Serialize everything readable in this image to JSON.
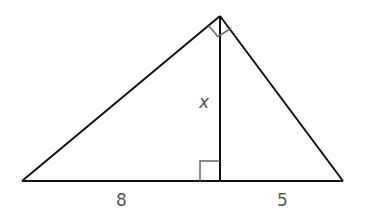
{
  "diagram": {
    "type": "right-triangle-with-altitude",
    "colors": {
      "stroke": "#111111",
      "marker": "#666666",
      "label": "#555555",
      "background": "#ffffff"
    },
    "points": {
      "apex": [
        220,
        16
      ],
      "left": [
        22,
        181
      ],
      "right": [
        343,
        181
      ],
      "foot": [
        220,
        181
      ]
    },
    "labels": {
      "left_segment": "8",
      "right_segment": "5",
      "altitude": "x"
    },
    "right_angle_markers": [
      {
        "location": "apex",
        "description": "right angle at top vertex"
      },
      {
        "location": "foot",
        "description": "right angle where altitude meets base"
      }
    ]
  }
}
